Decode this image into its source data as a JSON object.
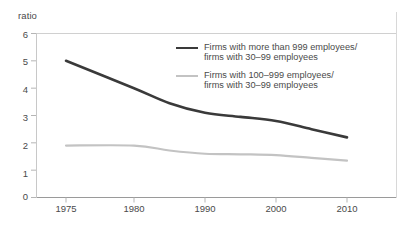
{
  "chart_data": {
    "type": "line",
    "title": "",
    "subtitle": "",
    "xlabel": "",
    "ylabel": "ratio",
    "ylim": [
      0,
      6
    ],
    "yticks": [
      0,
      1,
      2,
      3,
      4,
      5,
      6
    ],
    "xticks": [
      1975,
      1980,
      1990,
      2000,
      2010
    ],
    "xtick_labels": [
      "1975",
      "1980",
      "1990",
      "2000",
      "2010"
    ],
    "grid": false,
    "legend_position": "upper-right",
    "series": [
      {
        "name": "Firms with more than 999 employees/\nfirms with 30–99 employees",
        "color": "#3a3a3a",
        "x": [
          1975,
          1980,
          1985,
          1990,
          1995,
          2000,
          2005,
          2010
        ],
        "values": [
          5.0,
          4.0,
          3.45,
          3.1,
          2.95,
          2.8,
          2.5,
          2.2
        ]
      },
      {
        "name": "Firms with 100–999 employees/\nfirms with 30–99 employees",
        "color": "#c3c3c3",
        "x": [
          1975,
          1980,
          1985,
          1990,
          1995,
          2000,
          2005,
          2010
        ],
        "values": [
          1.9,
          1.9,
          1.72,
          1.6,
          1.58,
          1.55,
          1.45,
          1.35
        ]
      }
    ]
  },
  "axis": {
    "unit_label": "ratio",
    "y_labels": [
      "6",
      "5",
      "4",
      "3",
      "2",
      "1",
      "0"
    ],
    "x_labels": [
      "1975",
      "1980",
      "1990",
      "2000",
      "2010"
    ]
  },
  "legend": {
    "entries": [
      {
        "label": "Firms with more than 999 employees/\nfirms with 30–99 employees",
        "color": "#3a3a3a"
      },
      {
        "label": "Firms with 100–999 employees/\nfirms with 30–99 employees",
        "color": "#c3c3c3"
      }
    ]
  }
}
